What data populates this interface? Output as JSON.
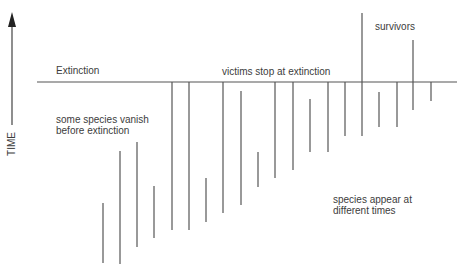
{
  "diagram": {
    "axis": {
      "label": "TIME",
      "direction": "up",
      "arrow_x": 12,
      "arrow_top": 12,
      "arrow_bottom": 125
    },
    "extinction_line": {
      "label": "Extinction",
      "y": 82,
      "x_start": 37,
      "x_end": 457
    },
    "annotations": {
      "extinction_label": "Extinction",
      "victims": "victims stop at extinction",
      "vanish": "some species vanish\nbefore extinction",
      "appear": "species appear at\ndifferent times",
      "survivors": "survivors"
    },
    "line_color": "#555555",
    "species_ranges": [
      {
        "x": 103,
        "top": 203,
        "bottom": 263
      },
      {
        "x": 120,
        "top": 151,
        "bottom": 264
      },
      {
        "x": 137,
        "top": 142,
        "bottom": 247
      },
      {
        "x": 154,
        "top": 186,
        "bottom": 238
      },
      {
        "x": 172,
        "top": 82,
        "bottom": 230
      },
      {
        "x": 189,
        "top": 82,
        "bottom": 230
      },
      {
        "x": 206,
        "top": 178,
        "bottom": 222
      },
      {
        "x": 223,
        "top": 82,
        "bottom": 213
      },
      {
        "x": 241,
        "top": 91,
        "bottom": 205
      },
      {
        "x": 258,
        "top": 152,
        "bottom": 187
      },
      {
        "x": 275,
        "top": 82,
        "bottom": 178
      },
      {
        "x": 293,
        "top": 82,
        "bottom": 170
      },
      {
        "x": 310,
        "top": 99,
        "bottom": 152
      },
      {
        "x": 328,
        "top": 82,
        "bottom": 152
      },
      {
        "x": 345,
        "top": 82,
        "bottom": 136
      },
      {
        "x": 362,
        "top": 13,
        "bottom": 136
      },
      {
        "x": 379,
        "top": 92,
        "bottom": 127
      },
      {
        "x": 397,
        "top": 82,
        "bottom": 127
      },
      {
        "x": 413,
        "top": 40,
        "bottom": 110
      },
      {
        "x": 431,
        "top": 82,
        "bottom": 101
      }
    ]
  }
}
